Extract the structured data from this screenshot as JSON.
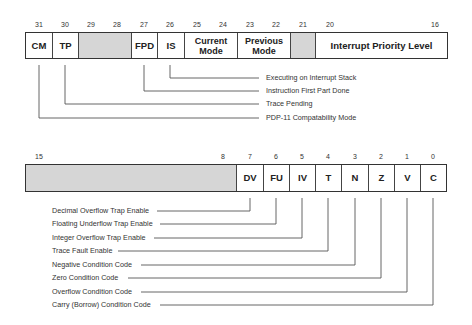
{
  "top_register": {
    "bit_numbers": [
      {
        "label": "31",
        "x": 39
      },
      {
        "label": "30",
        "x": 65
      },
      {
        "label": "29",
        "x": 91
      },
      {
        "label": "28",
        "x": 117
      },
      {
        "label": "27",
        "x": 144
      },
      {
        "label": "26",
        "x": 170
      },
      {
        "label": "25",
        "x": 197
      },
      {
        "label": "24",
        "x": 223
      },
      {
        "label": "23",
        "x": 250
      },
      {
        "label": "22",
        "x": 276
      },
      {
        "label": "21",
        "x": 303
      },
      {
        "label": "20",
        "x": 330
      },
      {
        "label": "16",
        "x": 435
      }
    ],
    "fields": [
      {
        "name": "cm",
        "label": "CM",
        "width": 26,
        "shaded": false
      },
      {
        "name": "tp",
        "label": "TP",
        "width": 26,
        "shaded": false
      },
      {
        "name": "reserved-29-28",
        "label": "",
        "width": 53,
        "shaded": true
      },
      {
        "name": "fpd",
        "label": "FPD",
        "width": 26,
        "shaded": false
      },
      {
        "name": "is",
        "label": "IS",
        "width": 27,
        "shaded": false
      },
      {
        "name": "current-mode",
        "label": "Current Mode",
        "width": 53,
        "shaded": false
      },
      {
        "name": "previous-mode",
        "label": "Previous Mode",
        "width": 53,
        "shaded": false
      },
      {
        "name": "reserved-21",
        "label": "",
        "width": 25,
        "shaded": true
      },
      {
        "name": "interrupt-priority-level",
        "label": "Interrupt Priority Level",
        "width": 133,
        "shaded": false
      }
    ],
    "callouts": [
      {
        "label": "Executing on Interrupt Stack",
        "bit": "IS"
      },
      {
        "label": "Instruction First Part Done",
        "bit": "FPD"
      },
      {
        "label": "Trace Pending",
        "bit": "TP"
      },
      {
        "label": "PDP-11 Compatability Mode",
        "bit": "CM"
      }
    ]
  },
  "bottom_register": {
    "bit_numbers": [
      {
        "label": "15",
        "x": 39
      },
      {
        "label": "8",
        "x": 223
      },
      {
        "label": "7",
        "x": 250
      },
      {
        "label": "6",
        "x": 276
      },
      {
        "label": "5",
        "x": 302
      },
      {
        "label": "4",
        "x": 328
      },
      {
        "label": "3",
        "x": 355
      },
      {
        "label": "2",
        "x": 381
      },
      {
        "label": "1",
        "x": 407
      },
      {
        "label": "0",
        "x": 433
      }
    ],
    "fields": [
      {
        "name": "reserved-15-8",
        "label": "",
        "width": 210,
        "shaded": true
      },
      {
        "name": "dv",
        "label": "DV",
        "width": 27,
        "shaded": false
      },
      {
        "name": "fu",
        "label": "FU",
        "width": 26,
        "shaded": false
      },
      {
        "name": "iv",
        "label": "IV",
        "width": 26,
        "shaded": false
      },
      {
        "name": "t",
        "label": "T",
        "width": 26,
        "shaded": false
      },
      {
        "name": "n",
        "label": "N",
        "width": 27,
        "shaded": false
      },
      {
        "name": "z",
        "label": "Z",
        "width": 26,
        "shaded": false
      },
      {
        "name": "v",
        "label": "V",
        "width": 26,
        "shaded": false
      },
      {
        "name": "c",
        "label": "C",
        "width": 26,
        "shaded": false
      }
    ],
    "callouts": [
      {
        "label": "Decimal Overflow Trap Enable",
        "bit": "DV"
      },
      {
        "label": "Floating Underflow Trap Enable",
        "bit": "FU"
      },
      {
        "label": "Integer Overflow Trap Enable",
        "bit": "IV"
      },
      {
        "label": "Trace Fault Enable",
        "bit": "T"
      },
      {
        "label": "Negative Condition Code",
        "bit": "N"
      },
      {
        "label": "Zero Condition Code",
        "bit": "Z"
      },
      {
        "label": "Overflow Condition Code",
        "bit": "V"
      },
      {
        "label": "Carry (Borrow) Condition Code",
        "bit": "C"
      }
    ]
  },
  "colors": {
    "line": "#444444",
    "border": "#333333",
    "shade": "#d6d6d6",
    "text": "#222222"
  }
}
